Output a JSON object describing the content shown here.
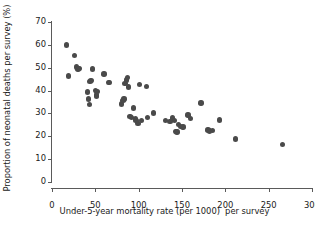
{
  "chart_data": {
    "type": "scatter",
    "title": "",
    "xlabel": "Under-5-year mortality rate (per 1000)  per survey",
    "ylabel": "Proportion of neonatal deaths per survey (%)",
    "xlim": [
      0,
      300
    ],
    "ylim": [
      0,
      70
    ],
    "xticks": [
      0,
      50,
      100,
      150,
      200,
      250,
      300
    ],
    "yticks": [
      0,
      10,
      20,
      30,
      40,
      50,
      60,
      70
    ],
    "xtick_labels": [
      "0",
      "50",
      "100",
      "150",
      "200",
      "250",
      "300"
    ],
    "ytick_labels": [
      "0",
      "10",
      "20",
      "30",
      "40",
      "50",
      "60",
      "70"
    ],
    "grid": false,
    "legend": null,
    "marker_color": "#4a4a4a",
    "marker_size": 5.4,
    "axis_color": "#5a5a5a",
    "background": "#ffffff",
    "points": [
      [
        17,
        59.9
      ],
      [
        19,
        46.4
      ],
      [
        26,
        55.4
      ],
      [
        28,
        50.3
      ],
      [
        30,
        49.4
      ],
      [
        31,
        49.7
      ],
      [
        41,
        39.4
      ],
      [
        42,
        36.3
      ],
      [
        43,
        34.0
      ],
      [
        44,
        44.0
      ],
      [
        45,
        44.3
      ],
      [
        47,
        49.5
      ],
      [
        50,
        40.0
      ],
      [
        51,
        38.0
      ],
      [
        51,
        37.3
      ],
      [
        52,
        39.5
      ],
      [
        60,
        47.2
      ],
      [
        65,
        43.5
      ],
      [
        66,
        43.6
      ],
      [
        80,
        34.1
      ],
      [
        82,
        35.6
      ],
      [
        83,
        36.3
      ],
      [
        84,
        43.0
      ],
      [
        86,
        44.6
      ],
      [
        87,
        45.7
      ],
      [
        88,
        41.5
      ],
      [
        90,
        28.7
      ],
      [
        92,
        28.3
      ],
      [
        94,
        32.3
      ],
      [
        96,
        27.6
      ],
      [
        97,
        26.9
      ],
      [
        99,
        25.6
      ],
      [
        101,
        42.7
      ],
      [
        103,
        27.0
      ],
      [
        109,
        41.8
      ],
      [
        110,
        28.3
      ],
      [
        117,
        30.2
      ],
      [
        131,
        26.8
      ],
      [
        136,
        26.4
      ],
      [
        139,
        28.0
      ],
      [
        141,
        27.0
      ],
      [
        143,
        22.0
      ],
      [
        144,
        21.9
      ],
      [
        146,
        25.2
      ],
      [
        148,
        24.3
      ],
      [
        151,
        24.1
      ],
      [
        157,
        29.4
      ],
      [
        160,
        27.7
      ],
      [
        172,
        34.5
      ],
      [
        180,
        22.8
      ],
      [
        182,
        22.4
      ],
      [
        185,
        22.6
      ],
      [
        193,
        27.1
      ],
      [
        212,
        18.8
      ],
      [
        266,
        16.5
      ]
    ]
  }
}
